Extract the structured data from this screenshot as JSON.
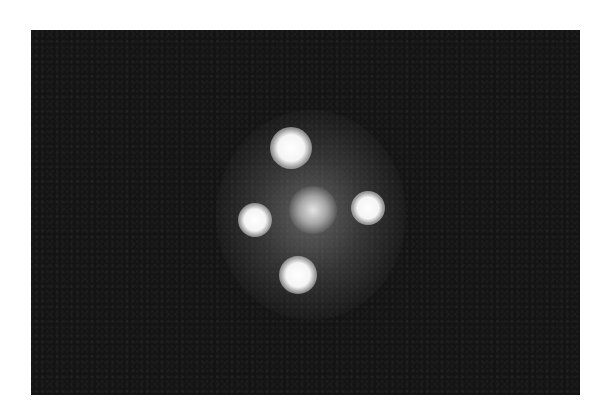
{
  "image": {
    "description": "Grayscale astronomical photograph of a quadruply lensed quasar (cross-shaped arrangement of four bright point images around a central diffuse galaxy) on a dark background",
    "background_color": "#141414",
    "frame": {
      "left": 31,
      "top": 30,
      "width": 549,
      "height": 365
    },
    "sources": [
      {
        "name": "image-top",
        "cx": 260,
        "cy": 118,
        "size": 42
      },
      {
        "name": "image-left",
        "cx": 224,
        "cy": 190,
        "size": 34
      },
      {
        "name": "image-right",
        "cx": 337,
        "cy": 178,
        "size": 34
      },
      {
        "name": "image-bottom",
        "cx": 267,
        "cy": 245,
        "size": 38
      }
    ],
    "core": {
      "name": "lens-galaxy-core",
      "cx": 282,
      "cy": 180,
      "size": 48
    },
    "halo": {
      "cx": 280,
      "cy": 185,
      "width": 190,
      "height": 210
    }
  }
}
